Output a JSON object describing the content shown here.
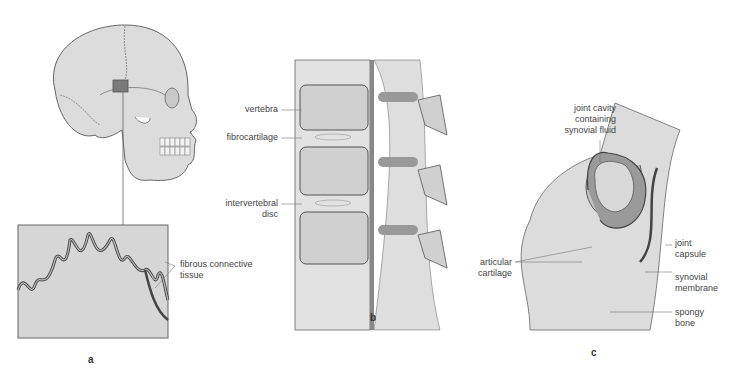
{
  "figure": {
    "panels": [
      {
        "id": "a",
        "letter": "a",
        "subject": "skull-suture",
        "labels": {
          "fibrous_1": "fibrous connective",
          "fibrous_2": "tissue"
        }
      },
      {
        "id": "b",
        "letter": "b",
        "subject": "vertebral-column",
        "labels": {
          "vertebra": "vertebra",
          "fibrocartilage": "fibrocartilage",
          "disc_1": "intervertebral",
          "disc_2": "disc"
        }
      },
      {
        "id": "c",
        "letter": "c",
        "subject": "synovial-joint",
        "labels": {
          "cavity_1": "joint cavity",
          "cavity_2": "containing",
          "cavity_3": "synovial fluid",
          "articular_1": "articular",
          "articular_2": "cartilage",
          "capsule_1": "joint",
          "capsule_2": "capsule",
          "synovial_1": "synovial",
          "synovial_2": "membrane",
          "spongy_1": "spongy",
          "spongy_2": "bone"
        }
      }
    ],
    "colors": {
      "bone": "#d9d9d9",
      "outline": "#555555",
      "dark": "#7a7a7a",
      "leader": "#777777",
      "text": "#444444"
    }
  }
}
